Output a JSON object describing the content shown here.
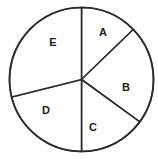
{
  "figure": {
    "name": "pie-chart",
    "background_color": "#ffffff",
    "width": 158,
    "height": 159
  },
  "chart_data": {
    "type": "pie",
    "title": "",
    "subtitle": "",
    "xlabel": "",
    "ylabel": "",
    "grid": false,
    "legend": false,
    "legend_position": "none",
    "labels_inside_slices": true,
    "geometry": {
      "center_x": 81.5,
      "center_y": 79.5,
      "radius": 72,
      "start_angle_deg": 0,
      "direction": "clockwise",
      "angle_origin": "12-o-clock"
    },
    "style": {
      "slice_fill": "#ffffff",
      "outline_color": "#2b2b2b",
      "outline_width": 1.7,
      "divider_width": 1.6,
      "label_color": "#1a1a1a"
    },
    "categories": [
      "A",
      "B",
      "C",
      "D",
      "E"
    ],
    "values": [
      46,
      80,
      54,
      76,
      104
    ],
    "value_unit": "degrees",
    "percentages": [
      12.8,
      22.2,
      15.0,
      21.1,
      28.9
    ],
    "slices": [
      {
        "label": "A",
        "start_angle_deg": 0,
        "end_angle_deg": 46,
        "sweep_deg": 46,
        "percent": 12.8,
        "label_x": 103,
        "label_y": 32
      },
      {
        "label": "B",
        "start_angle_deg": 46,
        "end_angle_deg": 126,
        "sweep_deg": 80,
        "percent": 22.2,
        "label_x": 126,
        "label_y": 87
      },
      {
        "label": "C",
        "start_angle_deg": 126,
        "end_angle_deg": 180,
        "sweep_deg": 54,
        "percent": 15.0,
        "label_x": 93,
        "label_y": 127
      },
      {
        "label": "D",
        "start_angle_deg": 180,
        "end_angle_deg": 256,
        "sweep_deg": 76,
        "percent": 21.1,
        "label_x": 46,
        "label_y": 110
      },
      {
        "label": "E",
        "start_angle_deg": 256,
        "end_angle_deg": 360,
        "sweep_deg": 104,
        "percent": 28.9,
        "label_x": 53,
        "label_y": 42
      }
    ]
  }
}
